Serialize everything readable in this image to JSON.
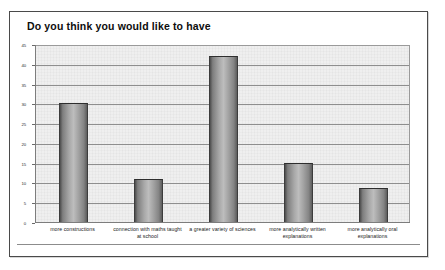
{
  "chart_data": {
    "type": "bar",
    "title": "Do you think you would like to have",
    "xlabel": "",
    "ylabel": "",
    "categories": [
      "more constructions",
      "connection with maths taught at school",
      "a greater variety of sciences",
      "more analytically written explanations",
      "more analytically oral explanations"
    ],
    "values": [
      30,
      11,
      42,
      15,
      8.5
    ],
    "ylim": [
      0,
      45
    ],
    "yticks": [
      0,
      5,
      10,
      15,
      20,
      25,
      30,
      35,
      40,
      45
    ],
    "ytick_labels": [
      "0",
      "5",
      "10",
      "15",
      "20",
      "25",
      "30",
      "35",
      "40",
      "45"
    ],
    "grid": true,
    "legend": false,
    "legend_position": "none",
    "colors": {
      "bar_fill_light": "#bdbdbd",
      "bar_fill_dark": "#4d4d4d",
      "bar_outline": "#2e2e2e",
      "plot_background": "#efefef",
      "gridline": "#8e8e8e",
      "frame": "#4a4a4a",
      "text": "#0d0d0d"
    }
  }
}
